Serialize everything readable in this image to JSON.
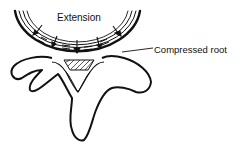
{
  "diagram": {
    "type": "anatomical-illustration",
    "labels": {
      "extension": "Extension",
      "compressed_root": "Compressed root"
    },
    "colors": {
      "line": "#111111",
      "background": "#ffffff"
    }
  }
}
